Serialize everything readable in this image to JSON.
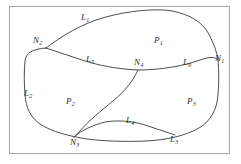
{
  "figure": {
    "type": "topology-diagram",
    "frame_color": "#a8a8a8",
    "stroke_color": "#3a3a3a",
    "background_color": "#ffffff",
    "label_color": "#2b2b2b"
  },
  "nodes": [
    {
      "id": "N1",
      "letter": "N",
      "subscript": "1",
      "x": 218,
      "y": 61
    },
    {
      "id": "N2",
      "letter": "N",
      "subscript": "2",
      "x": 37,
      "y": 43
    },
    {
      "id": "N3",
      "letter": "N",
      "subscript": "3",
      "x": 74,
      "y": 136
    },
    {
      "id": "N4",
      "letter": "N",
      "subscript": "4",
      "x": 138,
      "y": 65
    }
  ],
  "lines": [
    {
      "id": "L1",
      "letter": "L",
      "subscript": "1",
      "x": 83,
      "y": 16
    },
    {
      "id": "L2",
      "letter": "L",
      "subscript": "2",
      "x": 27,
      "y": 93
    },
    {
      "id": "L3",
      "letter": "L",
      "subscript": "3",
      "x": 173,
      "y": 137
    },
    {
      "id": "L4",
      "letter": "L",
      "subscript": "4",
      "x": 129,
      "y": 120
    },
    {
      "id": "L5",
      "letter": "L",
      "subscript": "5",
      "x": 89,
      "y": 59
    },
    {
      "id": "L6",
      "letter": "L",
      "subscript": "6",
      "x": 186,
      "y": 63
    }
  ],
  "polygons": [
    {
      "id": "P1",
      "letter": "P",
      "subscript": "1",
      "x": 157,
      "y": 40
    },
    {
      "id": "P2",
      "letter": "P",
      "subscript": "2",
      "x": 69,
      "y": 101
    },
    {
      "id": "P3",
      "letter": "P",
      "subscript": "3",
      "x": 190,
      "y": 101
    }
  ],
  "paths": {
    "outer_boundary": "M 46,48 C 60,38 78,26 100,19 C 126,11 150,9 168,11 C 186,13 200,20 207,32 C 214,44 217,54 218,60 C 219,70 219,82 218,94 C 217,108 212,120 200,128 C 186,136 168,140 148,141 C 126,142 104,141 88,139 C 70,137 52,133 40,125 C 30,118 26,108 25,96 C 24,84 24,72 25,62 C 26,54 32,50 46,48 Z",
    "arc_L5_L6": "M 46,48 C 60,52 72,56 84,60 C 98,64 116,68 138,69 C 160,69 182,66 200,60 C 210,57 215,56 218,60",
    "arc_L4": "M 138,69 C 132,80 124,90 112,100 C 100,110 88,120 80,130 C 76,134 74,136 74,137",
    "arc_N3_junction": "M 74,137 C 82,131 92,126 104,123 C 116,121 128,121 140,124 C 152,127 164,131 172,134"
  }
}
